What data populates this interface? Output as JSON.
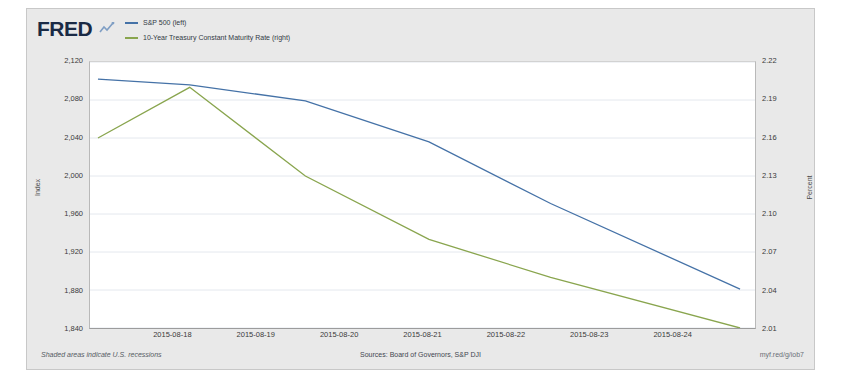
{
  "branding": {
    "logo_text": "FRED",
    "logo_glyph": "line-chart-glyph"
  },
  "footer": {
    "footnote": "Shaded areas indicate U.S. recessions",
    "sources": "Sources: Board of Governors, S&P DJI",
    "permalink": "myf.red/g/iob7"
  },
  "colors": {
    "sp500": "#4572a7",
    "treasury": "#89a54e",
    "plot_background": "#ffffff",
    "widget_background": "#e9e9e9",
    "gridline": "#e4e8ee",
    "logo": "#1a2a45"
  },
  "chart_data": {
    "type": "line",
    "title": "",
    "xlabel": "",
    "grid": true,
    "legend_position": "top-left",
    "x": [
      "2015-08-17",
      "2015-08-18",
      "2015-08-19",
      "2015-08-20",
      "2015-08-21",
      "2015-08-24"
    ],
    "xticks": [
      "2015-08-18",
      "2015-08-19",
      "2015-08-20",
      "2015-08-21",
      "2015-08-22",
      "2015-08-23",
      "2015-08-24"
    ],
    "axes": [
      {
        "side": "left",
        "label": "Index",
        "ylim": [
          1840,
          2120
        ],
        "ticks": [
          "1,840",
          "1,880",
          "1,920",
          "1,960",
          "2,000",
          "2,040",
          "2,080",
          "2,120"
        ],
        "tick_values": [
          1840,
          1880,
          1920,
          1960,
          2000,
          2040,
          2080,
          2120
        ]
      },
      {
        "side": "right",
        "label": "Percent",
        "ylim": [
          2.01,
          2.22
        ],
        "ticks": [
          "2.01",
          "2.04",
          "2.07",
          "2.10",
          "2.13",
          "2.16",
          "2.19",
          "2.22"
        ],
        "tick_values": [
          2.01,
          2.04,
          2.07,
          2.1,
          2.13,
          2.16,
          2.19,
          2.22
        ]
      }
    ],
    "series": [
      {
        "name": "S&P 500 (left)",
        "axis": "left",
        "color": "#4572a7",
        "units": "Index",
        "values": [
          2102,
          2096,
          2079,
          2036,
          1971,
          1881
        ]
      },
      {
        "name": "10-Year Treasury Constant Maturity Rate (right)",
        "axis": "right",
        "color": "#89a54e",
        "units": "Percent",
        "values": [
          2.16,
          2.2,
          2.13,
          2.08,
          2.05,
          2.01
        ]
      }
    ]
  }
}
